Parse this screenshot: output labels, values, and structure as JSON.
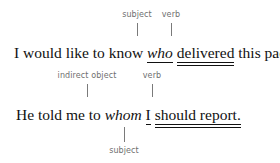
{
  "document": {
    "type": "grammar-annotation-diagram",
    "text_color": "#111111",
    "label_color": "#6f6f6f",
    "leader_color": "#7a7a7a",
    "background": "#ffffff"
  },
  "examples": [
    {
      "id": "example-1",
      "labels_above": [
        {
          "text": "subject",
          "role": "subject"
        },
        {
          "text": "verb",
          "role": "verb"
        }
      ],
      "labels_below": [],
      "sentence_parts": [
        {
          "text": "I would like to know ",
          "style": "plain",
          "underline": "none"
        },
        {
          "text": "who",
          "style": "italic",
          "underline": "single"
        },
        {
          "text": " ",
          "style": "plain",
          "underline": "none"
        },
        {
          "text": "delivered",
          "style": "plain",
          "underline": "double"
        },
        {
          "text": " this package.",
          "style": "plain",
          "underline": "none"
        }
      ],
      "sentence_plain": "I would like to know who delivered this package."
    },
    {
      "id": "example-2",
      "labels_above": [
        {
          "text": "indirect object",
          "role": "indirect object"
        },
        {
          "text": "verb",
          "role": "verb"
        }
      ],
      "labels_below": [
        {
          "text": "subject",
          "role": "subject"
        }
      ],
      "sentence_parts": [
        {
          "text": "He told me to ",
          "style": "plain",
          "underline": "none"
        },
        {
          "text": "whom",
          "style": "italic",
          "underline": "none"
        },
        {
          "text": " ",
          "style": "plain",
          "underline": "none"
        },
        {
          "text": "I",
          "style": "plain",
          "underline": "single"
        },
        {
          "text": " ",
          "style": "plain",
          "underline": "none"
        },
        {
          "text": "should report.",
          "style": "plain",
          "underline": "double"
        }
      ],
      "sentence_plain": "He told me to whom I should report."
    }
  ],
  "e1": {
    "label_subject": "subject",
    "label_verb": "verb",
    "s_a": "I would like to know ",
    "s_who": "who",
    "s_sp1": " ",
    "s_delivered": "delivered",
    "s_b": " this package."
  },
  "e2": {
    "label_indirect_object": "indirect object",
    "label_verb": "verb",
    "label_subject": "subject",
    "s_a": "He told me to ",
    "s_whom": "whom",
    "s_sp1": " ",
    "s_i": "I",
    "s_sp2": " ",
    "s_should_report": "should report."
  }
}
